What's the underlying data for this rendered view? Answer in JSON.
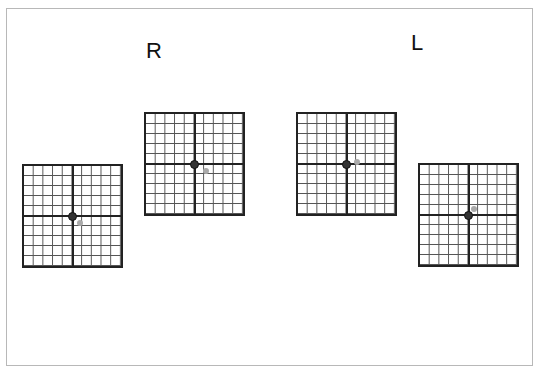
{
  "labels": {
    "right_eye": "R",
    "left_eye": "L"
  },
  "grids": [
    {
      "id": "r-lower",
      "eye": "R",
      "grid_cells": "10x10",
      "secondary_offset": "down-right"
    },
    {
      "id": "r-upper",
      "eye": "R",
      "grid_cells": "10x10",
      "secondary_offset": "down-right"
    },
    {
      "id": "l-upper",
      "eye": "L",
      "grid_cells": "10x10",
      "secondary_offset": "up-right"
    },
    {
      "id": "l-lower",
      "eye": "L",
      "grid_cells": "10x10",
      "secondary_offset": "up-right"
    }
  ],
  "colors": {
    "grid_line": "#555555",
    "border": "#222222",
    "fixation_dot": "#333333",
    "deviation_dot": "#aaaaaa"
  }
}
